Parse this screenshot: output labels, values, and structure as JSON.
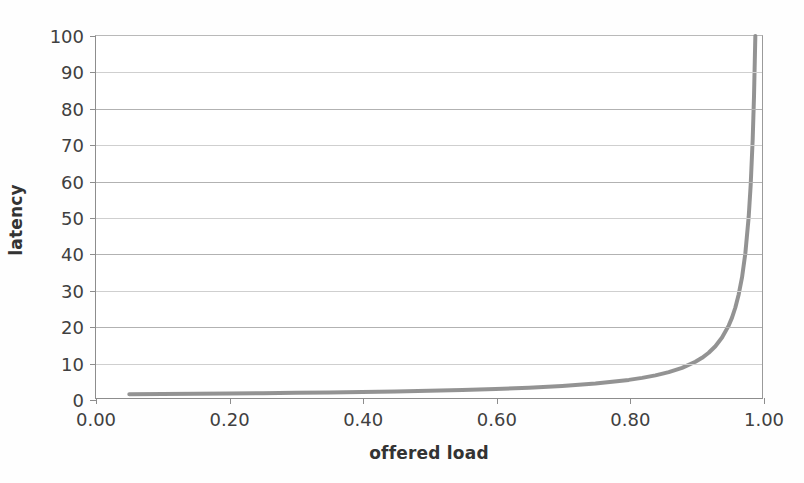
{
  "chart_data": {
    "type": "line",
    "title": "",
    "xlabel": "offered load",
    "ylabel": "latency",
    "xlim": [
      0.0,
      1.0
    ],
    "ylim": [
      0,
      100
    ],
    "grid": true,
    "legend": "none",
    "xticks": [
      "0.00",
      "0.20",
      "0.40",
      "0.60",
      "0.80",
      "1.00"
    ],
    "xtick_values": [
      0.0,
      0.2,
      0.4,
      0.6,
      0.8,
      1.0
    ],
    "yticks": [
      "0",
      "10",
      "20",
      "30",
      "40",
      "50",
      "60",
      "70",
      "80",
      "90",
      "100"
    ],
    "ytick_values": [
      0,
      10,
      20,
      30,
      40,
      50,
      60,
      70,
      80,
      90,
      100
    ],
    "series": [
      {
        "name": "latency",
        "color": "#8a8a8a",
        "x": [
          0.05,
          0.1,
          0.15,
          0.2,
          0.25,
          0.3,
          0.35,
          0.4,
          0.45,
          0.5,
          0.55,
          0.6,
          0.65,
          0.7,
          0.75,
          0.8,
          0.82,
          0.84,
          0.86,
          0.88,
          0.9,
          0.91,
          0.92,
          0.93,
          0.94,
          0.95,
          0.955,
          0.96,
          0.965,
          0.97,
          0.975,
          0.98,
          0.983,
          0.986,
          0.988,
          0.99,
          0.991,
          0.992
        ],
        "y": [
          1.05,
          1.11,
          1.18,
          1.25,
          1.33,
          1.43,
          1.54,
          1.67,
          1.82,
          2.0,
          2.22,
          2.5,
          2.86,
          3.33,
          4.0,
          5.0,
          5.56,
          6.25,
          7.14,
          8.33,
          10.0,
          11.1,
          12.5,
          14.3,
          16.7,
          20.0,
          22.2,
          25.0,
          28.6,
          33.3,
          40.0,
          50.0,
          58.8,
          71.4,
          83.3,
          100.0,
          111.0,
          125.0
        ]
      }
    ],
    "annotations": []
  },
  "figure": {
    "background": "#ffffff",
    "curve_color": "#8a8a8a",
    "gridline_color": "#b2b2b2",
    "axis_color": "#8d8d8d",
    "text_color": "#404040"
  }
}
